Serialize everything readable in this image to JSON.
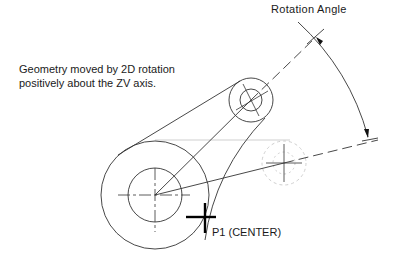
{
  "labels": {
    "rotation_angle": "Rotation Angle",
    "description_line1": "Geometry moved by 2D rotation",
    "description_line2": "positively about the ZV axis.",
    "p1": "P1 (CENTER)"
  },
  "colors": {
    "line": "#333333",
    "ghost": "#cfcfcf",
    "pick": "#000000"
  }
}
